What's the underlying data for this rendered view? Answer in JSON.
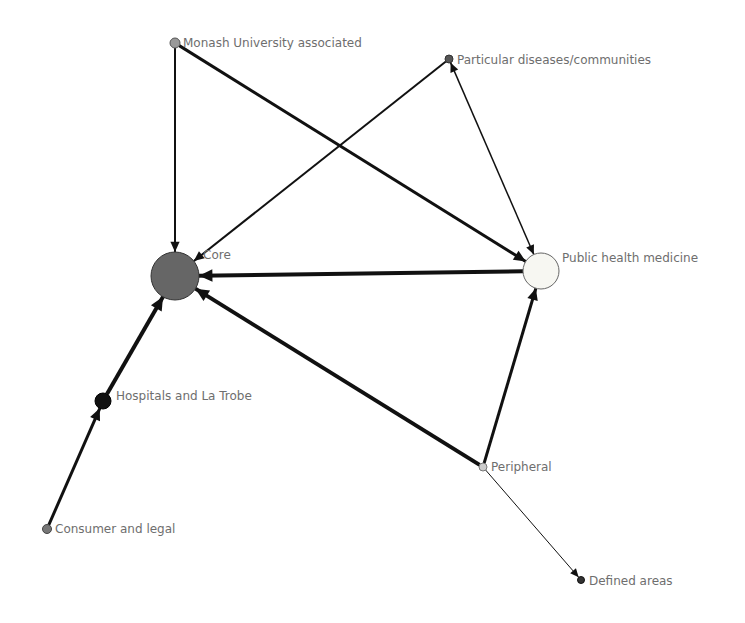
{
  "diagram": {
    "type": "directed-network",
    "nodes": [
      {
        "id": "core",
        "label": "Core",
        "x": 175,
        "y": 276,
        "r": 24,
        "fill": "#666666",
        "stroke": "#333333",
        "label_x": 203,
        "label_y": 259
      },
      {
        "id": "monash",
        "label": "Monash University associated",
        "x": 175,
        "y": 43,
        "r": 5,
        "fill": "#999999",
        "stroke": "#555555",
        "label_x": 183,
        "label_y": 47
      },
      {
        "id": "particular",
        "label": "Particular diseases/communities",
        "x": 449,
        "y": 59,
        "r": 4,
        "fill": "#555555",
        "stroke": "#333333",
        "label_x": 457,
        "label_y": 64
      },
      {
        "id": "public_health",
        "label": "Public health medicine",
        "x": 541,
        "y": 271,
        "r": 18,
        "fill": "#f7f7f2",
        "stroke": "#666666",
        "label_x": 562,
        "label_y": 262
      },
      {
        "id": "hospitals",
        "label": "Hospitals and La Trobe",
        "x": 103,
        "y": 401,
        "r": 8,
        "fill": "#111111",
        "stroke": "#000000",
        "label_x": 116,
        "label_y": 400
      },
      {
        "id": "consumer",
        "label": "Consumer and legal",
        "x": 47,
        "y": 529,
        "r": 4.5,
        "fill": "#777777",
        "stroke": "#444444",
        "label_x": 55,
        "label_y": 533
      },
      {
        "id": "peripheral",
        "label": "Peripheral",
        "x": 483,
        "y": 467,
        "r": 4,
        "fill": "#cccccc",
        "stroke": "#777777",
        "label_x": 491,
        "label_y": 471
      },
      {
        "id": "defined",
        "label": "Defined areas",
        "x": 581,
        "y": 580,
        "r": 3.5,
        "fill": "#333333",
        "stroke": "#111111",
        "label_x": 589,
        "label_y": 585
      }
    ],
    "edges": [
      {
        "from": "monash",
        "to": "core",
        "weight": 2,
        "bidirectional": false
      },
      {
        "from": "monash",
        "to": "public_health",
        "weight": 3,
        "bidirectional": false
      },
      {
        "from": "particular",
        "to": "core",
        "weight": 2,
        "bidirectional": false
      },
      {
        "from": "particular",
        "to": "public_health",
        "weight": 1.5,
        "bidirectional": true
      },
      {
        "from": "public_health",
        "to": "core",
        "weight": 4,
        "bidirectional": false
      },
      {
        "from": "peripheral",
        "to": "core",
        "weight": 4,
        "bidirectional": false
      },
      {
        "from": "peripheral",
        "to": "public_health",
        "weight": 3,
        "bidirectional": false
      },
      {
        "from": "peripheral",
        "to": "defined",
        "weight": 1,
        "bidirectional": false
      },
      {
        "from": "hospitals",
        "to": "core",
        "weight": 4,
        "bidirectional": false
      },
      {
        "from": "consumer",
        "to": "hospitals",
        "weight": 3,
        "bidirectional": false
      }
    ],
    "colors": {
      "edge": "#111111",
      "label": "#6e6e6e",
      "background": "#ffffff"
    }
  }
}
